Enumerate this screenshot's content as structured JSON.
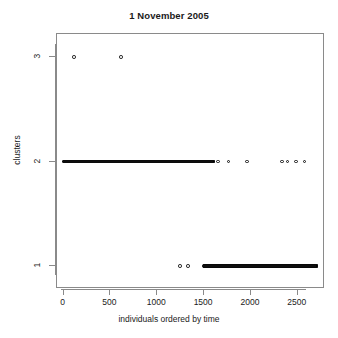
{
  "chart_data": {
    "type": "scatter",
    "title": "1 November 2005",
    "xlabel": "individuals ordered by time",
    "ylabel": "clusters",
    "xlim": [
      -70,
      2790
    ],
    "ylim": [
      0.78,
      3.22
    ],
    "grid": false,
    "legend": null,
    "xticks": [
      0,
      500,
      1000,
      1500,
      2000,
      2500
    ],
    "xtick_labels": [
      "0",
      "500",
      "1000",
      "1500",
      "2000",
      "2500"
    ],
    "yticks": [
      1,
      2,
      3
    ],
    "ytick_labels": [
      "1",
      "2",
      "3"
    ],
    "point_style": {
      "marker": "open-circle",
      "color": "#111111",
      "size": 3.6
    },
    "series": [
      {
        "name": "cluster 3",
        "y": 3,
        "x": [
          112,
          613
        ]
      },
      {
        "name": "cluster 2",
        "y": 2,
        "x_dense_runs": [
          [
            5,
            1600
          ]
        ],
        "x_isolated": [
          1650,
          1760,
          1960,
          2330,
          2390,
          2480,
          2570
        ]
      },
      {
        "name": "cluster 1",
        "y": 1,
        "x_dense_runs": [
          [
            1500,
            2700
          ]
        ],
        "x_isolated": [
          1245,
          1330
        ]
      }
    ],
    "counts": {
      "cluster_3": 2,
      "cluster_2": 1607,
      "cluster_1": 1202
    }
  }
}
